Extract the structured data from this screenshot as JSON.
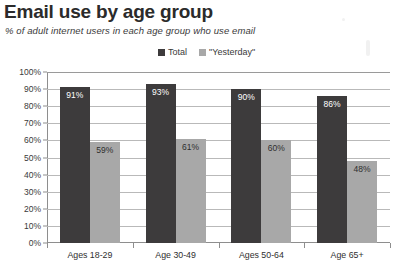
{
  "chart_data": {
    "type": "bar",
    "title": "Email use by age group",
    "subtitle": "% of adult internet users in each age group who use email",
    "xlabel": "",
    "ylabel": "",
    "categories": [
      "Ages 18-29",
      "Age 30-49",
      "Ages 50-64",
      "Age 65+"
    ],
    "series": [
      {
        "name": "Total",
        "color": "#3d3b3c",
        "values": [
          91,
          93,
          90,
          86
        ],
        "labels": [
          "91%",
          "93%",
          "90%",
          "86%"
        ]
      },
      {
        "name": "\"Yesterday\"",
        "color": "#a8a8a8",
        "values": [
          59,
          61,
          60,
          48
        ],
        "labels": [
          "59%",
          "61%",
          "60%",
          "48%"
        ]
      }
    ],
    "ylim": [
      0,
      100
    ],
    "ytick_values": [
      100,
      90,
      80,
      70,
      60,
      50,
      40,
      30,
      20,
      10,
      0
    ],
    "ytick_labels": [
      "100%",
      "90%",
      "80%",
      "70%",
      "60%",
      "50%",
      "40%",
      "30%",
      "20%",
      "10%",
      "0%"
    ],
    "grid": true,
    "legend_position": "top-center"
  },
  "legend": {
    "items": [
      {
        "label": "Total",
        "swatch_name": "legend-swatch-total"
      },
      {
        "label": "\"Yesterday\"",
        "swatch_name": "legend-swatch-yesterday"
      }
    ]
  }
}
